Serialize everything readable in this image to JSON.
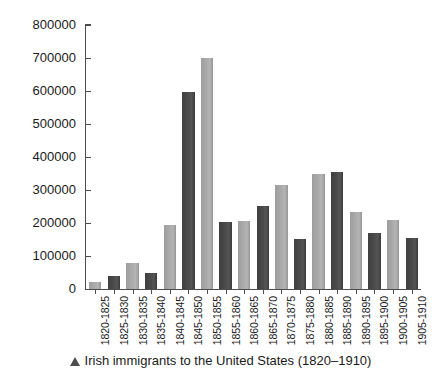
{
  "caption": {
    "marker_icon": "triangle-up-icon",
    "text": "Irish immigrants to the United States (1820–1910)"
  },
  "colors": {
    "bar_dark": "#4a4a4a",
    "bar_light": "#aaaaaa",
    "axis": "#4d4d4d",
    "text": "#1a1a1a",
    "background": "#ffffff"
  },
  "chart_data": {
    "type": "bar",
    "title": "Irish immigrants to the United States (1820–1910)",
    "xlabel": "",
    "ylabel": "",
    "ylim": [
      0,
      800000
    ],
    "ytick_labels": [
      "800000",
      "700000",
      "600000",
      "500000",
      "400000",
      "300000",
      "200000",
      "100000",
      "0"
    ],
    "ytick_values": [
      800000,
      700000,
      600000,
      500000,
      400000,
      300000,
      200000,
      100000,
      0
    ],
    "grid": false,
    "legend": false,
    "categories": [
      "1820-1825",
      "1825-1830",
      "1830-1835",
      "1835-1840",
      "1840-1845",
      "1845-1850",
      "1850-1855",
      "1855-1860",
      "1860-1865",
      "1865-1870",
      "1870-1875",
      "1875-1880",
      "1880-1885",
      "1885-1890",
      "1890-1895",
      "1895-1900",
      "1900-1905",
      "1905-1910"
    ],
    "values": [
      20000,
      40000,
      78000,
      50000,
      195000,
      597000,
      700000,
      203000,
      205000,
      253000,
      315000,
      152000,
      350000,
      355000,
      233000,
      170000,
      210000,
      155000
    ],
    "bar_colors": [
      "light",
      "dark",
      "light",
      "dark",
      "light",
      "dark",
      "light",
      "dark",
      "light",
      "dark",
      "light",
      "dark",
      "light",
      "dark",
      "light",
      "dark",
      "light",
      "dark"
    ]
  }
}
